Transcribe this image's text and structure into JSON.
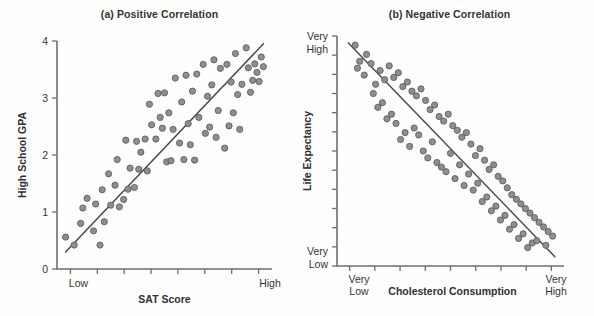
{
  "figure": {
    "background_color": "#ffffff",
    "point_fill_color": "#8f8f8f",
    "point_stroke_color": "#5d5d5d",
    "axis_color": "#6e6e6e",
    "trend_line_color": "#4a4a4a"
  },
  "panels": {
    "a": {
      "title": "(a) Positive Correlation",
      "xlabel": "SAT Score",
      "ylabel": "High School GPA",
      "ytick_labels": [
        "0",
        "1",
        "2",
        "3",
        "4"
      ],
      "xtick_labels": [
        "Low",
        "High"
      ]
    },
    "b": {
      "title": "(b) Negative Correlation",
      "xlabel": "Cholesterol Consumption",
      "ylabel": "Life Expectancy",
      "ytick_top_line1": "Very",
      "ytick_top_line2": "High",
      "ytick_bottom_line1": "Very",
      "ytick_bottom_line2": "Low",
      "xtick_left_line1": "Very",
      "xtick_left_line2": "Low",
      "xtick_right_line1": "Very",
      "xtick_right_line2": "High"
    }
  },
  "chart_data": [
    {
      "type": "scatter",
      "panel": "a",
      "title": "(a) Positive Correlation",
      "xlabel": "SAT Score",
      "ylabel": "High School GPA",
      "xlim": [
        0,
        100
      ],
      "ylim": [
        0,
        4
      ],
      "xtick_values": [
        0,
        100
      ],
      "xtick_labels": [
        "Low",
        "High"
      ],
      "ytick_values": [
        0,
        1,
        2,
        3,
        4
      ],
      "ytick_labels": [
        "0",
        "1",
        "2",
        "3",
        "4"
      ],
      "grid": false,
      "legend": "none",
      "trend_line": {
        "x0": 4,
        "y0": 0.3,
        "x1": 96,
        "y1": 3.95
      },
      "x": [
        4,
        8,
        11,
        12,
        14,
        17,
        18,
        20,
        21,
        22,
        24,
        25,
        27,
        28,
        29,
        31,
        32,
        33,
        34,
        36,
        37,
        38,
        39,
        41,
        42,
        43,
        44,
        46,
        47,
        48,
        49,
        50,
        51,
        52,
        53,
        54,
        55,
        57,
        58,
        59,
        60,
        61,
        62,
        63,
        64,
        65,
        66,
        68,
        69,
        70,
        71,
        72,
        73,
        74,
        75,
        76,
        78,
        79,
        80,
        81,
        82,
        83,
        84,
        85,
        86,
        88,
        89,
        90,
        91,
        92,
        93,
        94,
        95,
        96
      ],
      "y": [
        0.56,
        0.42,
        0.8,
        1.07,
        1.24,
        0.67,
        1.14,
        0.42,
        1.39,
        0.83,
        1.67,
        1.12,
        1.47,
        1.92,
        1.09,
        1.22,
        2.26,
        1.4,
        1.77,
        1.43,
        2.24,
        1.75,
        2.05,
        2.28,
        1.72,
        2.89,
        2.53,
        2.28,
        3.08,
        2.66,
        2.47,
        3.09,
        1.88,
        2.74,
        1.9,
        2.45,
        3.35,
        2.21,
        2.93,
        1.92,
        3.4,
        2.55,
        2.18,
        3.12,
        1.91,
        3.42,
        2.66,
        3.59,
        2.38,
        3.03,
        2.49,
        3.23,
        3.67,
        2.31,
        2.78,
        3.52,
        2.12,
        3.59,
        2.51,
        3.28,
        2.74,
        3.78,
        3.06,
        2.45,
        3.24,
        3.88,
        3.53,
        3.1,
        3.31,
        3.6,
        3.45,
        3.29,
        3.72,
        3.55
      ]
    },
    {
      "type": "scatter",
      "panel": "b",
      "title": "(b) Negative Correlation",
      "xlabel": "Cholesterol Consumption",
      "ylabel": "Life Expectancy",
      "xlim": [
        0,
        100
      ],
      "ylim": [
        0,
        100
      ],
      "xtick_values": [
        0,
        100
      ],
      "xtick_labels": [
        "Very Low",
        "Very High"
      ],
      "ytick_values": [
        0,
        100
      ],
      "ytick_labels": [
        "Very Low",
        "Very High"
      ],
      "grid": false,
      "legend": "none",
      "trend_line": {
        "x0": 5,
        "y0": 97,
        "x1": 96,
        "y1": 4
      },
      "x": [
        8,
        10,
        9,
        13,
        15,
        17,
        12,
        19,
        21,
        16,
        23,
        25,
        20,
        27,
        18,
        29,
        31,
        24,
        33,
        26,
        35,
        22,
        37,
        30,
        39,
        28,
        41,
        34,
        43,
        32,
        45,
        36,
        47,
        38,
        49,
        42,
        51,
        40,
        53,
        44,
        55,
        46,
        57,
        50,
        59,
        48,
        61,
        54,
        63,
        52,
        65,
        58,
        67,
        56,
        69,
        62,
        71,
        60,
        73,
        66,
        75,
        64,
        77,
        70,
        79,
        68,
        81,
        74,
        83,
        72,
        85,
        78,
        87,
        76,
        89,
        82,
        91,
        80,
        93,
        86,
        95,
        84,
        88,
        92
      ],
      "y": [
        96,
        89,
        86,
        92,
        88,
        79,
        83,
        85,
        81,
        75,
        87,
        82,
        71,
        84,
        69,
        78,
        80,
        66,
        76,
        62,
        74,
        64,
        77,
        58,
        72,
        55,
        68,
        60,
        70,
        52,
        65,
        57,
        63,
        50,
        66,
        54,
        61,
        47,
        59,
        45,
        56,
        43,
        58,
        49,
        53,
        41,
        48,
        44,
        51,
        38,
        46,
        40,
        42,
        35,
        44,
        36,
        39,
        33,
        37,
        30,
        34,
        28,
        31,
        26,
        29,
        24,
        27,
        22,
        25,
        20,
        23,
        18,
        21,
        16,
        19,
        14,
        17,
        12,
        15,
        10,
        13,
        8,
        11,
        9
      ]
    }
  ]
}
